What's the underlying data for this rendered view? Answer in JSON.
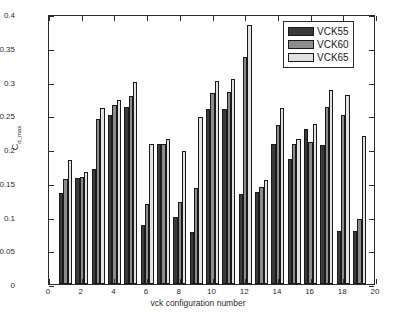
{
  "chart_data": {
    "type": "bar",
    "title": "",
    "xlabel": "vck configuration number",
    "ylabel": "C_d_max",
    "ylabel_base": "C",
    "ylabel_sub": "d_max",
    "xlim": [
      0,
      20
    ],
    "ylim": [
      0,
      0.4
    ],
    "ytick_labels": [
      "0",
      "0.05",
      "0.1",
      "0.15",
      "0.2",
      "0.25",
      "0.3",
      "0.35",
      "0.4"
    ],
    "ytick_values": [
      0,
      0.05,
      0.1,
      0.15,
      0.2,
      0.25,
      0.3,
      0.35,
      0.4
    ],
    "xtick_labels": [
      "0",
      "2",
      "4",
      "6",
      "8",
      "10",
      "12",
      "14",
      "16",
      "18",
      "20"
    ],
    "xtick_values": [
      0,
      2,
      4,
      6,
      8,
      10,
      12,
      14,
      16,
      18,
      20
    ],
    "grid": false,
    "legend_position": "top-right",
    "categories": [
      1,
      2,
      3,
      4,
      5,
      6,
      7,
      8,
      9,
      10,
      11,
      12,
      13,
      14,
      15,
      16,
      17,
      18,
      19
    ],
    "series": [
      {
        "name": "VCK55",
        "color": "#3a3a3a",
        "values": [
          0.135,
          0.157,
          0.17,
          0.25,
          0.262,
          0.088,
          0.207,
          0.1,
          0.077,
          0.259,
          0.26,
          0.133,
          0.137,
          0.207,
          0.185,
          0.229,
          0.206,
          0.079,
          0.078
        ]
      },
      {
        "name": "VCK60",
        "color": "#8c8c8c",
        "values": [
          0.155,
          0.159,
          0.245,
          0.265,
          0.279,
          0.119,
          0.207,
          0.122,
          0.142,
          0.283,
          0.285,
          0.336,
          0.143,
          0.236,
          0.208,
          0.21,
          0.262,
          0.251,
          0.097
        ]
      },
      {
        "name": "VCK65",
        "color": "#e2e2e2",
        "values": [
          0.184,
          0.166,
          0.261,
          0.273,
          0.299,
          0.207,
          0.215,
          0.197,
          0.247,
          0.301,
          0.303,
          0.383,
          0.154,
          0.261,
          0.215,
          0.237,
          0.287,
          0.28,
          0.219
        ]
      }
    ]
  },
  "legend": {
    "items": [
      {
        "label": "VCK55",
        "color": "#3a3a3a"
      },
      {
        "label": "VCK60",
        "color": "#8c8c8c"
      },
      {
        "label": "VCK65",
        "color": "#e2e2e2"
      }
    ]
  }
}
